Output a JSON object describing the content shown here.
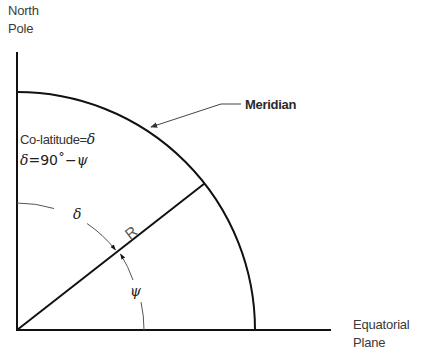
{
  "diagram": {
    "type": "geometry",
    "labels": {
      "north_pole_line1": "North",
      "north_pole_line2": "Pole",
      "meridian": "Meridian",
      "colatitude": "Co-latitude=",
      "colatitude_symbol": "δ",
      "equation_delta": "δ",
      "equation_rest": "=90˚−",
      "equation_psi": "ψ",
      "radius": "R",
      "angle_delta": "δ",
      "angle_psi": "ψ",
      "equatorial_line1": "Equatorial",
      "equatorial_line2": "Plane"
    },
    "geometry": {
      "origin": [
        17,
        330
      ],
      "meridian_radius": 238,
      "angle_arc_radius": 127,
      "radius_line_angle_deg": 38
    },
    "colors": {
      "line": "#111111",
      "thin_line": "#555555",
      "text": "#3a3a3a"
    }
  }
}
